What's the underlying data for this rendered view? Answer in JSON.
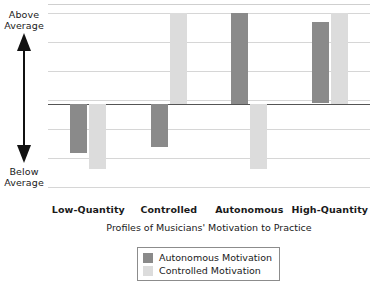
{
  "axis_annotation": {
    "above_line1": "Above",
    "above_line2": "Average",
    "below_line1": "Below",
    "below_line2": "Average",
    "arrow_icon": "double-headed-vertical-arrow"
  },
  "legend": {
    "entries": [
      {
        "label": "Autonomous Motivation",
        "color": "#8a8a8a"
      },
      {
        "label": "Controlled Motivation",
        "color": "#dcdcdc"
      }
    ]
  },
  "chart_data": {
    "type": "bar",
    "title": "",
    "xlabel": "Profiles of Musicians' Motivation to Practice",
    "ylabel": "",
    "categories": [
      "Low-Quantity",
      "Controlled",
      "Autonomous",
      "High-Quantity"
    ],
    "series": [
      {
        "name": "Autonomous Motivation",
        "color": "#8a8a8a",
        "values": [
          -0.55,
          -0.48,
          1.0,
          0.9
        ]
      },
      {
        "name": "Controlled Motivation",
        "color": "#dcdcdc",
        "values": [
          -0.72,
          1.0,
          -0.72,
          1.0
        ]
      }
    ],
    "ylim": [
      -1.1,
      1.1
    ],
    "ytick_labels": [
      "Above Average",
      "Below Average"
    ],
    "ytick_values": [
      1.0,
      -1.0
    ],
    "gridlines": [
      1.0,
      0.68,
      0.36,
      0.04,
      -0.28,
      -0.6,
      -0.92
    ],
    "zero_line": 0,
    "grid": true,
    "legend_position": "bottom-center"
  }
}
